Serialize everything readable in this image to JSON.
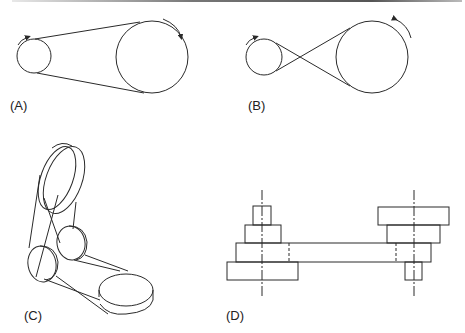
{
  "figure": {
    "panels": [
      {
        "id": "A",
        "label": "(A)",
        "description": "Open belt drive, both pulleys rotate in same direction",
        "pulleys": [
          {
            "cx": 34,
            "cy": 56,
            "r": 17
          },
          {
            "cx": 152,
            "cy": 57,
            "r": 36
          }
        ]
      },
      {
        "id": "B",
        "label": "(B)",
        "description": "Crossed belt drive, pulleys rotate in opposite directions",
        "pulleys": [
          {
            "cx": 264,
            "cy": 57,
            "r": 18
          },
          {
            "cx": 372,
            "cy": 57,
            "r": 36
          }
        ]
      },
      {
        "id": "C",
        "label": "(C)",
        "description": "Quarter-turn belt drive with guide pulleys (isometric view)"
      },
      {
        "id": "D",
        "label": "(D)",
        "description": "Stepped cone pulleys with shifting belt (side view)"
      }
    ]
  },
  "colors": {
    "stroke": "#2a2a2a",
    "background": "#ffffff",
    "rule": "#666666"
  }
}
